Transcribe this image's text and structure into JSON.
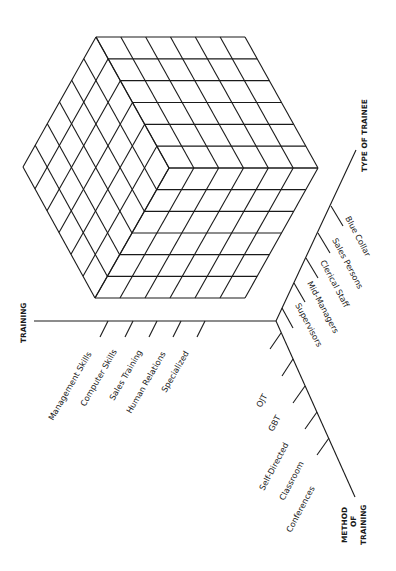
{
  "diagram": {
    "type": "three-dimensional training matrix cube",
    "cube": {
      "divisions_per_edge": 6,
      "line_color": "#1a1a1a"
    },
    "axes": {
      "training": {
        "title": "TRAINING",
        "items": [
          "Management Skills",
          "Computer Skills",
          "Sales Training",
          "Human Relations",
          "Specialized"
        ]
      },
      "type_of_trainee": {
        "title": "TYPE OF TRAINEE",
        "items": [
          "Supervisors",
          "Mid-Managers",
          "Clerical Staff",
          "Sales Persons",
          "Blue Collar"
        ]
      },
      "method_of_training": {
        "title_lines": [
          "METHOD",
          "OF",
          "TRAINING"
        ],
        "items": [
          "OJT",
          "GBT",
          "Self-Directed",
          "Classroom",
          "Conferences"
        ]
      }
    }
  }
}
